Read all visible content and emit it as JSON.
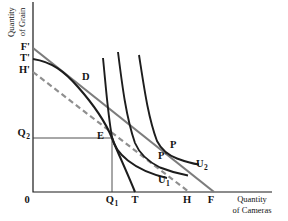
{
  "colors": {
    "axis": "#1a1a1a",
    "curve": "#1d1d1d",
    "price_line": "#7c7c7c",
    "trade_line": "#8f8f8f",
    "reference_line": "#3d3d3d",
    "text": "#141414"
  },
  "axis_titles": {
    "y_line1": "Quantity",
    "y_line2": "of Grain",
    "x_line1": "Quantity",
    "x_line2": "of Cameras"
  },
  "axis_labels": {
    "origin": "0",
    "f_prime": "F'",
    "t_prime": "T'",
    "h_prime": "H'",
    "q2": {
      "base": "Q",
      "sub": "2"
    },
    "q1": {
      "base": "Q",
      "sub": "1"
    },
    "t": "T",
    "h": "H",
    "f": "F"
  },
  "point_labels": {
    "d": "D",
    "e": "E",
    "p": "P",
    "p_prime": "P'"
  },
  "curve_labels": {
    "u1": {
      "base": "U",
      "sub": "1"
    },
    "u2": {
      "base": "U",
      "sub": "2"
    }
  }
}
